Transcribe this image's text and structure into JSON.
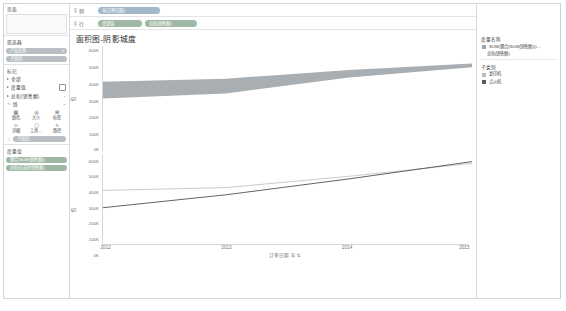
{
  "sidebar": {
    "pages_label": "页面",
    "filters_label": "筛选器",
    "filter_pills": [
      {
        "label": "产品名称",
        "color": "gray"
      },
      {
        "label": "子类别",
        "color": "gray"
      }
    ],
    "marks_label": "标记",
    "mark_rows": [
      {
        "label": "全部"
      },
      {
        "label": "度量值"
      },
      {
        "label": "总和(销售额)"
      }
    ],
    "mark_type": "线",
    "mark_buttons": [
      {
        "icon": "color-icon",
        "glyph": "▦",
        "label": "颜色"
      },
      {
        "icon": "size-icon",
        "glyph": "◎",
        "label": "大小"
      },
      {
        "icon": "label-icon",
        "glyph": "⊞",
        "label": "标签"
      },
      {
        "icon": "detail-icon",
        "glyph": "⊹",
        "label": "详细"
      },
      {
        "icon": "tooltip-icon",
        "glyph": "▢",
        "label": "工具…"
      },
      {
        "icon": "path-icon",
        "glyph": "∿",
        "label": "路径"
      }
    ],
    "subcategory_row": "子类别",
    "measure_values_label": "度量值",
    "measure_pills": [
      {
        "label": "聚合(SUM(销售额))",
        "color": "green"
      },
      {
        "label": "总和(先前的销售额)",
        "color": "green"
      }
    ]
  },
  "shelves": {
    "columns_label": "列",
    "rows_label": "行",
    "columns_pills": [
      {
        "label": "年(订单日期)",
        "color": "blue"
      }
    ],
    "rows_pills": [
      {
        "label": "度量值",
        "color": "green"
      },
      {
        "label": "总和(销售额)",
        "color": "green"
      }
    ]
  },
  "chart_title": "面积图-阴影城度",
  "legend": {
    "measure_names_title": "度量名称",
    "measure_names_items": [
      {
        "label": "SUM(聚合(SUM(销售额)))…",
        "color": "#9aa7b3"
      },
      {
        "label": "总和(销售额)",
        "color": "#9aa7b3"
      }
    ],
    "subcategory_title": "子类别",
    "subcategory_items": [
      {
        "label": "复印机",
        "color": "#b4bcc4"
      },
      {
        "label": "点火机",
        "color": "#5c5c5c"
      }
    ]
  },
  "chart_data": {
    "type": "area",
    "title": "面积图-阴影城度",
    "xlabel": "订单日期 年",
    "ylabel": "值",
    "x": [
      2012,
      2013,
      2014,
      2015
    ],
    "xlim": [
      2012,
      2015
    ],
    "ylim": [
      0,
      600000
    ],
    "yticks": [
      0,
      100000,
      200000,
      300000,
      400000,
      500000,
      600000
    ],
    "yticklabels": [
      "0K",
      "100K",
      "200K",
      "300K",
      "400K",
      "500K",
      "600K"
    ],
    "grid": false,
    "legend_position": "right",
    "panes": [
      {
        "name": "度量值",
        "type": "area",
        "series": [
          {
            "name": "上边界",
            "values": [
              400000,
              418000,
              470000,
              508000
            ],
            "color": "#a9aeb2"
          },
          {
            "name": "下边界",
            "values": [
              300000,
              330000,
              425000,
              486000
            ],
            "color": "#a9aeb2"
          }
        ],
        "band_fill": "#a9aeb2"
      },
      {
        "name": "总和(销售额)",
        "type": "line",
        "series": [
          {
            "name": "复印机",
            "values": [
              372000,
              392000,
              470000,
              560000
            ],
            "color": "#b4bcc4"
          },
          {
            "name": "点火机",
            "values": [
              252000,
              342000,
              452000,
              572000
            ],
            "color": "#4a4a4a"
          }
        ]
      }
    ]
  },
  "caption": ""
}
